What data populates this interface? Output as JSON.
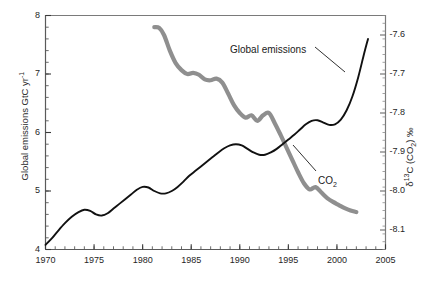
{
  "chart_data": {
    "type": "line",
    "title": "",
    "xlabel": "",
    "ylabel": "Global emissions GtC yr-1",
    "xlim": [
      1970,
      2005
    ],
    "ylim": [
      4,
      8
    ],
    "y2lim": [
      -8.15,
      -7.55
    ],
    "grid": false,
    "legend_position": "inline-annotations",
    "x_ticks": [
      1970,
      1975,
      1980,
      1985,
      1990,
      1995,
      2000,
      2005
    ],
    "x_tick_labels": [
      "1970",
      "1975",
      "1980",
      "1985",
      "1990",
      "1995",
      "2000",
      "2005"
    ],
    "x_minor_tick_step": 1,
    "y_ticks": [
      4,
      5,
      6,
      7,
      8
    ],
    "y_tick_labels": [
      "4",
      "5",
      "6",
      "7",
      "8"
    ],
    "y_minor_tick_step": 0.2,
    "y2_ticks": [
      -8.1,
      -8.0,
      -7.9,
      -7.8,
      -7.7,
      -7.6
    ],
    "y2_tick_labels": [
      "-8.1",
      "-8.0",
      "-7.9",
      "-7.8",
      "-7.7",
      "-7.6"
    ],
    "y2_minor_tick_step": 0.02,
    "series": [
      {
        "name": "Global emissions",
        "axis": "left",
        "color": "#111111",
        "width": 1.9,
        "x": [
          1970.0,
          1970.6,
          1971.3,
          1972.0,
          1972.7,
          1973.4,
          1974.0,
          1974.6,
          1975.2,
          1975.8,
          1976.4,
          1977.0,
          1977.6,
          1978.2,
          1978.8,
          1979.4,
          1980.0,
          1980.6,
          1981.2,
          1981.8,
          1982.4,
          1983.0,
          1983.6,
          1984.2,
          1984.8,
          1985.4,
          1986.0,
          1986.6,
          1987.2,
          1987.8,
          1988.4,
          1989.0,
          1989.6,
          1990.2,
          1990.8,
          1991.4,
          1992.0,
          1992.6,
          1993.2,
          1993.8,
          1994.4,
          1995.0,
          1995.6,
          1996.2,
          1996.8,
          1997.4,
          1998.0,
          1998.6,
          1999.2,
          1999.8,
          2000.4,
          2001.0,
          2001.6,
          2002.2,
          2002.8,
          2003.2
        ],
        "y": [
          4.08,
          4.18,
          4.32,
          4.45,
          4.56,
          4.64,
          4.68,
          4.66,
          4.6,
          4.58,
          4.62,
          4.7,
          4.78,
          4.86,
          4.94,
          5.02,
          5.07,
          5.06,
          5.0,
          4.96,
          4.96,
          5.0,
          5.07,
          5.16,
          5.26,
          5.34,
          5.42,
          5.5,
          5.58,
          5.66,
          5.73,
          5.78,
          5.8,
          5.78,
          5.72,
          5.66,
          5.62,
          5.62,
          5.66,
          5.72,
          5.8,
          5.88,
          5.96,
          6.05,
          6.14,
          6.2,
          6.21,
          6.17,
          6.13,
          6.14,
          6.22,
          6.38,
          6.62,
          6.95,
          7.35,
          7.6
        ]
      },
      {
        "name": "CO2",
        "axis": "right",
        "color": "#8f8f8f",
        "width": 4.2,
        "x": [
          1981.2,
          1981.7,
          1982.2,
          1982.8,
          1983.4,
          1984.0,
          1984.6,
          1985.2,
          1985.8,
          1986.4,
          1987.0,
          1987.6,
          1988.2,
          1988.8,
          1989.4,
          1990.0,
          1990.6,
          1991.2,
          1991.8,
          1992.4,
          1993.0,
          1993.6,
          1994.2,
          1994.8,
          1995.4,
          1996.0,
          1996.6,
          1997.2,
          1997.8,
          1998.4,
          1999.0,
          1999.6,
          2000.2,
          2000.8,
          2001.4,
          2002.0
        ],
        "y": [
          -7.58,
          -7.582,
          -7.6,
          -7.64,
          -7.672,
          -7.69,
          -7.7,
          -7.697,
          -7.702,
          -7.714,
          -7.716,
          -7.712,
          -7.722,
          -7.75,
          -7.78,
          -7.8,
          -7.812,
          -7.806,
          -7.82,
          -7.806,
          -7.8,
          -7.826,
          -7.856,
          -7.888,
          -7.92,
          -7.952,
          -7.98,
          -7.996,
          -7.99,
          -8.004,
          -8.018,
          -8.028,
          -8.036,
          -8.044,
          -8.05,
          -8.054
        ]
      }
    ],
    "annotations": [
      {
        "text": "Global emissions",
        "x_px": 230,
        "y_px": 44
      },
      {
        "text_main": "CO",
        "text_sub": "2",
        "x_px": 318,
        "y_px": 175
      }
    ]
  },
  "axis_titles": {
    "left_main": "Global emissions GtC yr",
    "left_sup": "-1",
    "right_delta": "δ",
    "right_sup": "13",
    "right_mid": "C (CO",
    "right_sub": "2",
    "right_tail": ") ‰"
  },
  "caption": {
    "text": ""
  }
}
